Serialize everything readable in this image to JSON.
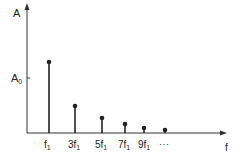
{
  "chart_data": {
    "type": "bar",
    "subtype": "stem",
    "title": "",
    "xlabel": "f",
    "ylabel": "A",
    "y_reference_label": "A0",
    "y_reference_value": 55,
    "categories": [
      "f1",
      "3f1",
      "5f1",
      "7f1",
      "9f1",
      "..."
    ],
    "values": [
      71,
      27,
      15,
      9,
      5,
      3
    ],
    "grid": false,
    "legend": "none"
  },
  "labels": {
    "y_axis": "A",
    "a0_main": "A",
    "a0_sub": "0",
    "x_axis": "f",
    "ticks": [
      {
        "main": "f",
        "sub": "1",
        "prefix": ""
      },
      {
        "main": "f",
        "sub": "1",
        "prefix": "3"
      },
      {
        "main": "f",
        "sub": "1",
        "prefix": "5"
      },
      {
        "main": "f",
        "sub": "1",
        "prefix": "7"
      },
      {
        "main": "f",
        "sub": "1",
        "prefix": "9"
      }
    ],
    "ellipsis": "· · ·"
  },
  "colors": {
    "ink": "#222222"
  }
}
